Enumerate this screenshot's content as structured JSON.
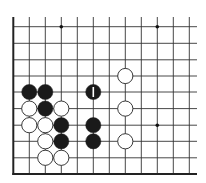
{
  "diagram": {
    "type": "go-board-fragment",
    "colors": {
      "background": "#ffffff",
      "line": "#333333",
      "edge": "#222222",
      "black_stone": "#1a1a1a",
      "white_stone": "#ffffff",
      "white_stone_outline": "#222222",
      "marker": "#ffffff",
      "star_point": "#111111"
    },
    "grid": {
      "x_lines": [
        13.3,
        29.3,
        45.3,
        61.3,
        77.3,
        93.3,
        109.3,
        125.3,
        141.3,
        157.3,
        173.3,
        189.3
      ],
      "y_lines": [
        26.7,
        43.3,
        59.8,
        76.0,
        92.0,
        108.6,
        125.2,
        141.3,
        157.8,
        174.0
      ],
      "line_top": 17,
      "line_right": 197,
      "left_edge_x": 13.3,
      "bottom_edge_y": 174.0
    },
    "star_points": [
      {
        "col": 3,
        "row": 0
      },
      {
        "col": 9,
        "row": 0
      },
      {
        "col": 9,
        "row": 6
      }
    ],
    "stones": [
      {
        "color": "black",
        "col": 1,
        "row": 4
      },
      {
        "color": "black",
        "col": 2,
        "row": 4
      },
      {
        "color": "black",
        "col": 5,
        "row": 4,
        "marker": "I"
      },
      {
        "color": "white",
        "col": 7,
        "row": 3
      },
      {
        "color": "white",
        "col": 1,
        "row": 5
      },
      {
        "color": "black",
        "col": 2,
        "row": 5
      },
      {
        "color": "white",
        "col": 3,
        "row": 5
      },
      {
        "color": "white",
        "col": 7,
        "row": 5
      },
      {
        "color": "white",
        "col": 1,
        "row": 6
      },
      {
        "color": "white",
        "col": 2,
        "row": 6
      },
      {
        "color": "black",
        "col": 3,
        "row": 6
      },
      {
        "color": "black",
        "col": 5,
        "row": 6
      },
      {
        "color": "white",
        "col": 2,
        "row": 7
      },
      {
        "color": "black",
        "col": 3,
        "row": 7
      },
      {
        "color": "black",
        "col": 5,
        "row": 7
      },
      {
        "color": "white",
        "col": 7,
        "row": 7
      },
      {
        "color": "white",
        "col": 2,
        "row": 8
      },
      {
        "color": "white",
        "col": 3,
        "row": 8
      }
    ],
    "stone_radius": 7.6
  }
}
